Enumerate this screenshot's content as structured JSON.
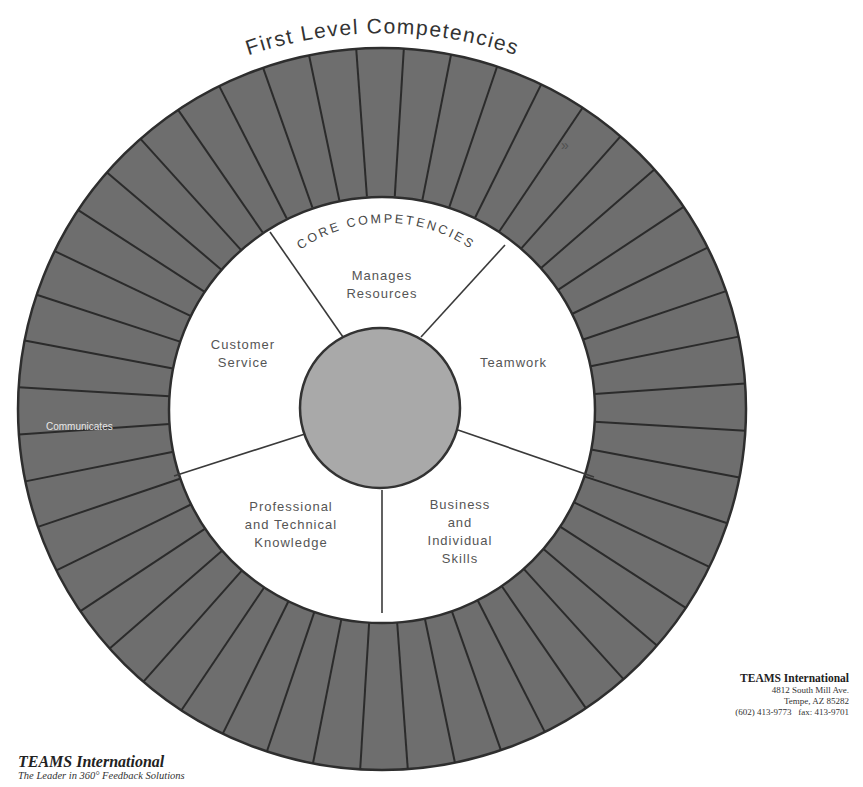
{
  "title": "First Level Competencies",
  "core_title": "CORE COMPETENCIES",
  "core_segments": [
    {
      "label_lines": [
        "Manages",
        "Resources"
      ]
    },
    {
      "label_lines": [
        "Teamwork"
      ]
    },
    {
      "label_lines": [
        "Business",
        "and",
        "Individual",
        "Skills"
      ]
    },
    {
      "label_lines": [
        "Professional",
        "and Technical",
        "Knowledge"
      ]
    },
    {
      "label_lines": [
        "Customer",
        "Service"
      ]
    }
  ],
  "outer_ring": {
    "segment_count": 48,
    "labeled_segment": "Communicates"
  },
  "stray_mark": "»",
  "colors": {
    "outer_ring": "#6e6e6e",
    "outer_ring_stroke": "#2e2e2e",
    "core_fill": "#ffffff",
    "center_circle": "#a9a9a9",
    "text_gray": "#555555"
  },
  "footer_left": {
    "brand": "TEAMS International",
    "tagline": "The Leader in 360° Feedback Solutions"
  },
  "footer_right": {
    "brand": "TEAMS International",
    "address_line1": "4812 South Mill Ave.",
    "address_line2": "Tempe, AZ 85282",
    "phone_fax": "(602) 413-9773   fax: 413-9701"
  }
}
